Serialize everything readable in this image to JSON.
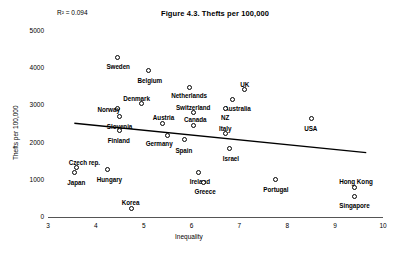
{
  "chart_data": {
    "type": "scatter",
    "title": "Figure 4.3. Thefts per 100,000",
    "xlabel": "Inequality",
    "ylabel": "Thefts per 100,000",
    "xlim": [
      3,
      10
    ],
    "ylim": [
      0,
      5000
    ],
    "xticks": [
      "3",
      "4",
      "5",
      "6",
      "7",
      "8",
      "9",
      "10"
    ],
    "yticks": [
      "0",
      "1000",
      "2000",
      "3000",
      "4000",
      "5000"
    ],
    "grid": false,
    "legend": "none",
    "annotations": [
      {
        "name": "r-squared",
        "text": "R² = 0.094"
      }
    ],
    "trendline": {
      "name": "linear-fit",
      "x0": 3.55,
      "y0": 2520,
      "x1": 9.65,
      "y1": 1730
    },
    "points": [
      {
        "label": "Sweden",
        "x": 4.45,
        "y": 4300,
        "lx": -11,
        "ly": 6
      },
      {
        "label": "Belgium",
        "x": 5.1,
        "y": 3930,
        "lx": -11,
        "ly": 6
      },
      {
        "label": "Netherlands",
        "x": 5.95,
        "y": 3490,
        "lx": -18,
        "ly": 5
      },
      {
        "label": "UK",
        "x": 7.1,
        "y": 3420,
        "lx": -4,
        "ly": -9
      },
      {
        "label": "Denmark",
        "x": 4.95,
        "y": 3040,
        "lx": -18,
        "ly": -9
      },
      {
        "label": "Australia",
        "x": 6.85,
        "y": 3170,
        "lx": -8,
        "ly": 6
      },
      {
        "label": "Norway",
        "x": 4.45,
        "y": 2910,
        "lx": -20,
        "ly": -3
      },
      {
        "label": "NZ",
        "x": 6.7,
        "y": 2930,
        "lx": -4,
        "ly": 6
      },
      {
        "label": "Switzerland",
        "x": 6.05,
        "y": 2800,
        "lx": -18,
        "ly": -9
      },
      {
        "label": "Slovenia",
        "x": 4.5,
        "y": 2700,
        "lx": -13,
        "ly": 6
      },
      {
        "label": "Austria",
        "x": 5.4,
        "y": 2520,
        "lx": -10,
        "ly": -9
      },
      {
        "label": "Canada",
        "x": 6.05,
        "y": 2460,
        "lx": -10,
        "ly": -9
      },
      {
        "label": "USA",
        "x": 8.5,
        "y": 2640,
        "lx": -7,
        "ly": 6
      },
      {
        "label": "Finland",
        "x": 4.5,
        "y": 2320,
        "lx": -12,
        "ly": 6
      },
      {
        "label": "Germany",
        "x": 5.5,
        "y": 2190,
        "lx": -22,
        "ly": 4
      },
      {
        "label": "Spain",
        "x": 5.85,
        "y": 2080,
        "lx": -9,
        "ly": 7
      },
      {
        "label": "Italy",
        "x": 6.7,
        "y": 2240,
        "lx": -6,
        "ly": -9
      },
      {
        "label": "Israel",
        "x": 6.8,
        "y": 1840,
        "lx": -7,
        "ly": 6
      },
      {
        "label": "Czech rep.",
        "x": 3.6,
        "y": 1320,
        "lx": -8,
        "ly": -9
      },
      {
        "label": "Japan",
        "x": 3.55,
        "y": 1190,
        "lx": -7,
        "ly": 6
      },
      {
        "label": "Hungary",
        "x": 4.25,
        "y": 1270,
        "lx": -11,
        "ly": 6
      },
      {
        "label": "Ireland",
        "x": 6.15,
        "y": 1200,
        "lx": -9,
        "ly": 6
      },
      {
        "label": "Greece",
        "x": 6.25,
        "y": 940,
        "lx": -9,
        "ly": 6
      },
      {
        "label": "Portugal",
        "x": 7.75,
        "y": 1000,
        "lx": -12,
        "ly": 6
      },
      {
        "label": "Hong Kong",
        "x": 9.4,
        "y": 800,
        "lx": -15,
        "ly": -9
      },
      {
        "label": "Singapore",
        "x": 9.4,
        "y": 560,
        "lx": -15,
        "ly": 6
      },
      {
        "label": "Korea",
        "x": 4.75,
        "y": 230,
        "lx": -10,
        "ly": -9
      }
    ]
  }
}
